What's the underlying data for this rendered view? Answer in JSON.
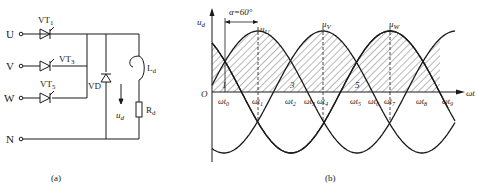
{
  "figure_a": {
    "caption": "(a)",
    "terminals": [
      "U",
      "V",
      "W",
      "N"
    ],
    "thyristors": [
      "VT1",
      "VT3",
      "VT5"
    ],
    "diode": "VD",
    "inductor": "Ld",
    "resistor": "Rd",
    "output_voltage": "ud"
  },
  "figure_b": {
    "caption": "(b)",
    "y_axis_label": "ud",
    "x_axis_label": "ωt",
    "origin_label": "O",
    "alpha_label": "α=60°",
    "phase_labels": [
      "uU",
      "uV",
      "uW"
    ],
    "region_labels": [
      "1",
      "3",
      "5"
    ],
    "time_ticks": [
      "ωt0",
      "ωt1",
      "ωt2",
      "ωt3",
      "ωt4",
      "ωt5",
      "ωt6",
      "ωt7",
      "ωt8",
      "ωt9"
    ]
  },
  "chart_data": {
    "type": "line",
    "xlabel": "ωt",
    "ylabel": "ud",
    "series": [
      {
        "name": "uU",
        "description": "phase U sinusoid, peak at ωt1"
      },
      {
        "name": "uV",
        "description": "phase V sinusoid, peak at ωt4"
      },
      {
        "name": "uW",
        "description": "phase W sinusoid, peak at ωt7"
      }
    ],
    "alpha_deg": 60,
    "shaded": "hatched output voltage ud regions under phase voltages, segments numbered 1, 3, 5",
    "grid": false
  }
}
